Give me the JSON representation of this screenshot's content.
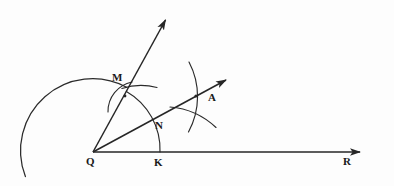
{
  "figure": {
    "background_color": "#fdfdfd",
    "ink_color": "#262626",
    "width": 394,
    "height": 186,
    "labels": [
      {
        "id": "Q",
        "text": "Q",
        "x": 86,
        "y": 156,
        "role": "vertex-label-q"
      },
      {
        "id": "K",
        "text": "K",
        "x": 154,
        "y": 157,
        "role": "vertex-label-k"
      },
      {
        "id": "M",
        "text": "M",
        "x": 112,
        "y": 72,
        "role": "vertex-label-m"
      },
      {
        "id": "N",
        "text": "N",
        "x": 155,
        "y": 120,
        "role": "vertex-label-n"
      },
      {
        "id": "A",
        "text": "A",
        "x": 208,
        "y": 92,
        "role": "vertex-label-a"
      },
      {
        "id": "R",
        "text": "R",
        "x": 343,
        "y": 156,
        "role": "vertex-label-r"
      }
    ],
    "points": {
      "Q": [
        93,
        152
      ],
      "K": [
        160,
        152
      ],
      "M": [
        125,
        96
      ],
      "N": [
        152,
        124
      ],
      "A": [
        196,
        96
      ],
      "R_tip": [
        369,
        152
      ],
      "upper_ray_tip": [
        168,
        12
      ],
      "bisector_tip": [
        233,
        74
      ]
    },
    "rays": [
      {
        "name": "ray-QR",
        "from": "Q",
        "to": "R_tip",
        "arrow": true
      },
      {
        "name": "ray-QM-upper",
        "from": "Q",
        "to": "upper_ray_tip",
        "arrow": true
      },
      {
        "name": "ray-QA-bisector",
        "from": "Q",
        "to": "bisector_tip",
        "arrow": true
      }
    ],
    "arcs": [
      {
        "name": "large-arc-left",
        "center": "Q",
        "radius": 72,
        "start_deg": 160,
        "end_deg": 298
      },
      {
        "name": "arc-M-N-K",
        "center": "Q",
        "radius": 67,
        "start_deg": 240,
        "end_deg": 360
      },
      {
        "name": "arc-from-M-to-A",
        "center": "M",
        "radius": 72,
        "start_deg": 330,
        "end_deg": 45
      },
      {
        "name": "arc-from-K-to-A",
        "center": "K",
        "radius": 72,
        "start_deg": 285,
        "end_deg": 20
      },
      {
        "name": "arc-stub-right-of-M",
        "center": "Q",
        "radius": 67,
        "start_deg": 300,
        "end_deg": 333
      }
    ]
  }
}
